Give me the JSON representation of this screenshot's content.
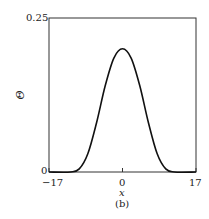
{
  "chart_data": {
    "type": "line",
    "title": "",
    "caption": "(b)",
    "xlabel": "x",
    "ylabel": "Θ",
    "xlim": [
      -17,
      17
    ],
    "ylim": [
      0,
      0.25
    ],
    "xticks": [
      "−17",
      "0",
      "17"
    ],
    "yticks": [
      "0",
      "0.25"
    ],
    "grid": false,
    "legend": null,
    "series": [
      {
        "name": "Θ(x)",
        "x": [
          -17,
          -12,
          -10,
          -8,
          -6,
          -4,
          -2,
          0,
          2,
          4,
          6,
          8,
          10,
          12,
          17
        ],
        "y": [
          0,
          0,
          0.005,
          0.03,
          0.08,
          0.14,
          0.185,
          0.2,
          0.185,
          0.14,
          0.08,
          0.03,
          0.005,
          0,
          0
        ]
      }
    ]
  },
  "labels": {
    "y_top": "0.25",
    "y_bottom": "0",
    "x_left": "−17",
    "x_mid": "0",
    "x_right": "17",
    "xlabel": "x",
    "ylabel": "Θ",
    "caption": "(b)"
  }
}
